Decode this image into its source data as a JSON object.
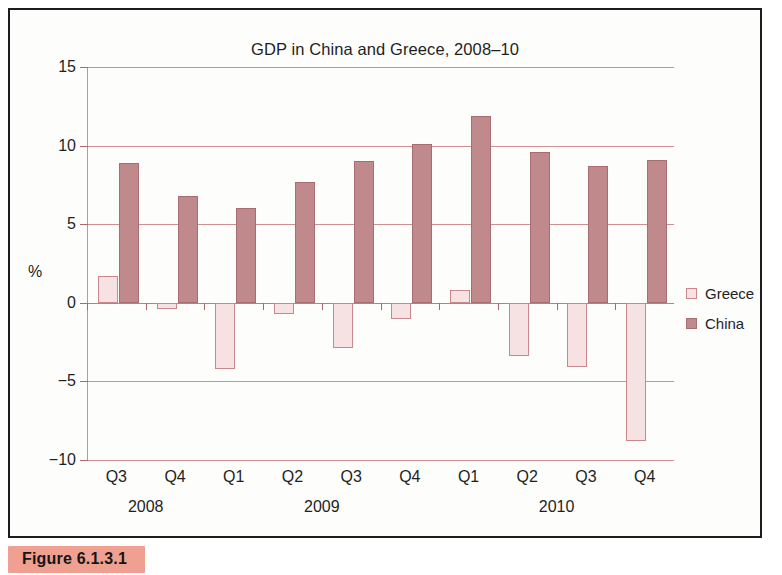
{
  "figure": {
    "caption": "Figure 6.1.3.1"
  },
  "chart_data": {
    "type": "bar",
    "title": "GDP in China and Greece, 2008–10",
    "xlabel": "",
    "ylabel": "%",
    "ylim": [
      -10,
      15
    ],
    "yticks": [
      15,
      10,
      5,
      0,
      -5,
      -10
    ],
    "ytick_labels": [
      "15",
      "10",
      "5",
      "0",
      "−5",
      "−10"
    ],
    "grid": true,
    "legend_position": "right",
    "categories": [
      "Q3",
      "Q4",
      "Q1",
      "Q2",
      "Q3",
      "Q4",
      "Q1",
      "Q2",
      "Q3",
      "Q4"
    ],
    "group_labels": [
      {
        "label": "2008",
        "start": 0,
        "end": 1
      },
      {
        "label": "2009",
        "start": 2,
        "end": 5
      },
      {
        "label": "2010",
        "start": 6,
        "end": 9
      }
    ],
    "series": [
      {
        "name": "Greece",
        "color": "#f6e2e2",
        "border": "#c8888c",
        "values": [
          1.7,
          -0.4,
          -4.2,
          -0.7,
          -2.9,
          -1.0,
          0.8,
          -3.4,
          -4.1,
          -8.8
        ]
      },
      {
        "name": "China",
        "color": "#c08a8c",
        "border": "#a96c70",
        "values": [
          8.9,
          6.8,
          6.0,
          7.7,
          9.0,
          10.1,
          11.9,
          9.6,
          8.7,
          9.1
        ]
      }
    ]
  }
}
